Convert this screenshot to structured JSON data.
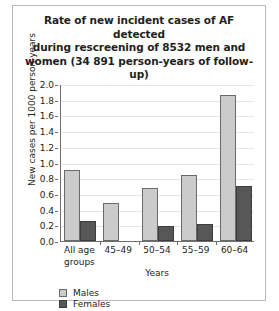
{
  "chart_data": {
    "type": "bar",
    "title_lines": [
      "Rate of new incident cases of AF detected",
      "during rescreening of 8532 men and",
      "women (34 891 person-years of follow-up)"
    ],
    "xlabel": "Years",
    "ylabel": "New cases per 1000 person-years",
    "categories": [
      "All age groups",
      "45–49",
      "50–54",
      "55–59",
      "60–64"
    ],
    "category_lines": [
      [
        "All age",
        "groups"
      ],
      [
        "45–49"
      ],
      [
        "50–54"
      ],
      [
        "55–59"
      ],
      [
        "60–64"
      ]
    ],
    "series": [
      {
        "name": "Males",
        "color": "#cbcbcb",
        "values": [
          0.9,
          0.49,
          0.68,
          0.84,
          1.86
        ]
      },
      {
        "name": "Females",
        "color": "#575757",
        "values": [
          0.26,
          0.0,
          0.19,
          0.22,
          0.7
        ]
      }
    ],
    "ylim": [
      0.0,
      2.0
    ],
    "yticks": [
      "2.0",
      "1.8",
      "1.6",
      "1.4",
      "1.2",
      "1.0",
      "0.8",
      "0.6",
      "0.4",
      "0.2",
      "0.0"
    ],
    "ytick_values": [
      2.0,
      1.8,
      1.6,
      1.4,
      1.2,
      1.0,
      0.8,
      0.6,
      0.4,
      0.2,
      0.0
    ],
    "grid": true,
    "legend_position": "bottom-left",
    "legend": [
      "Males",
      "Females"
    ]
  }
}
